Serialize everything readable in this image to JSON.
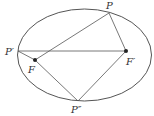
{
  "diagram": {
    "type": "ellipse-foci-geometry",
    "colors": {
      "stroke": "#555555",
      "point": "#222222",
      "text": "#333333"
    },
    "ellipse": {
      "cx": 84.5,
      "cy": 55,
      "rx": 67,
      "ry": 46
    },
    "points": {
      "P": {
        "label": "P",
        "x": 109,
        "y": 13
      },
      "P1": {
        "label": "P′",
        "x": 18,
        "y": 51
      },
      "P2": {
        "label": "P″",
        "x": 78,
        "y": 101
      },
      "F": {
        "label": "F",
        "x": 35,
        "y": 60
      },
      "F1": {
        "label": "F′",
        "x": 126,
        "y": 51
      }
    },
    "segments": [
      [
        "P1",
        "F1"
      ],
      [
        "P1",
        "F"
      ],
      [
        "F",
        "P"
      ],
      [
        "P",
        "F1"
      ],
      [
        "F",
        "P2"
      ],
      [
        "P2",
        "F1"
      ]
    ]
  }
}
